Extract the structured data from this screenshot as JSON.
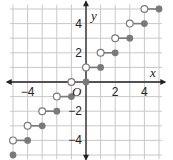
{
  "chart_data": {
    "type": "scatter",
    "title": "",
    "xlabel": "x",
    "ylabel": "y",
    "origin_label": "O",
    "xlim": [
      -5,
      5
    ],
    "ylim": [
      -5,
      5
    ],
    "grid": true,
    "x_ticks": [
      {
        "value": -4,
        "label": "−4"
      },
      {
        "value": 2,
        "label": "2"
      },
      {
        "value": 4,
        "label": "4"
      }
    ],
    "y_ticks": [
      {
        "value": 4,
        "label": "4"
      },
      {
        "value": 2,
        "label": "2"
      },
      {
        "value": -2,
        "label": "−2"
      },
      {
        "value": -4,
        "label": "−4"
      }
    ],
    "function": "ceiling",
    "segments": [
      {
        "y": 5,
        "x_open": 4,
        "x_closed": 5
      },
      {
        "y": 4,
        "x_open": 3,
        "x_closed": 4
      },
      {
        "y": 3,
        "x_open": 2,
        "x_closed": 3
      },
      {
        "y": 2,
        "x_open": 1,
        "x_closed": 2
      },
      {
        "y": 1,
        "x_open": 0,
        "x_closed": 1
      },
      {
        "y": 0,
        "x_open": -1,
        "x_closed": 0
      },
      {
        "y": -1,
        "x_open": -2,
        "x_closed": -1
      },
      {
        "y": -2,
        "x_open": -3,
        "x_closed": -2
      },
      {
        "y": -3,
        "x_open": -4,
        "x_closed": -3
      },
      {
        "y": -4,
        "x_open": -5,
        "x_closed": -4
      },
      {
        "y": -5,
        "x_open": null,
        "x_closed": -5
      }
    ],
    "colors": {
      "grid": "#c8c8c8",
      "axis": "#222222",
      "point": "#7a7a7a"
    }
  }
}
